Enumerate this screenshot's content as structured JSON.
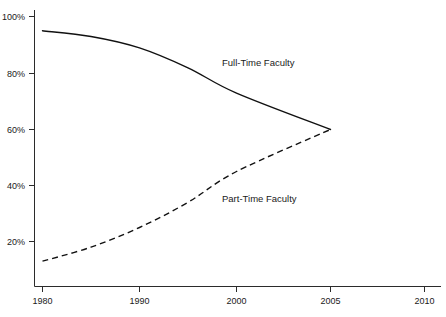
{
  "chart_data": {
    "type": "line",
    "title": "",
    "subtitle": "",
    "xlabel": "",
    "ylabel": "",
    "grid": false,
    "legend_position": "inline-annotation",
    "x_ticks": [
      "1980",
      "1990",
      "2000",
      "2005",
      "2010"
    ],
    "x_tick_values": [
      1980,
      1990,
      2000,
      2005,
      2010
    ],
    "y_ticks": [
      "20%",
      "40%",
      "60%",
      "80%",
      "100%"
    ],
    "y_tick_values": [
      20,
      40,
      60,
      80,
      100
    ],
    "ylim": [
      0,
      100
    ],
    "xlim": [
      1980,
      2010
    ],
    "series": [
      {
        "name": "Full-Time Faculty",
        "style": "solid",
        "color": "#111111",
        "x": [
          1980,
          1985,
          1990,
          1995,
          2000,
          2005
        ],
        "values": [
          95,
          93,
          89,
          82,
          73,
          60
        ]
      },
      {
        "name": "Part-Time Faculty",
        "style": "dashed",
        "color": "#111111",
        "x": [
          1980,
          1985,
          1990,
          1995,
          2000,
          2005
        ],
        "values": [
          13,
          18,
          25,
          34,
          45,
          60
        ]
      }
    ],
    "annotations": [
      {
        "text": "Full-Time Faculty",
        "x_px": 222,
        "y_px": 66
      },
      {
        "text": "Part-Time Faculty",
        "x_px": 222,
        "y_px": 202
      }
    ]
  },
  "axis": {
    "y_tick_100": "100%",
    "y_tick_80": "80%",
    "y_tick_60": "60%",
    "y_tick_40": "40%",
    "y_tick_20": "20%",
    "x_tick_1980": "1980",
    "x_tick_1990": "1990",
    "x_tick_2000": "2000",
    "x_tick_2005": "2005",
    "x_tick_2010": "2010"
  },
  "labels": {
    "full_time": "Full-Time Faculty",
    "part_time": "Part-Time Faculty"
  },
  "colors": {
    "line": "#111111",
    "axis": "#2b2b2b",
    "background": "#ffffff",
    "text": "#1a1a1a"
  }
}
